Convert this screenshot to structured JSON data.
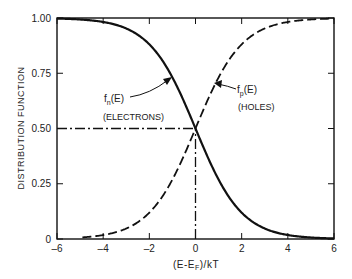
{
  "chart_data": {
    "type": "line",
    "title": "",
    "xlabel": "(E-E_F)/kT",
    "ylabel": "DISTRIBUTION FUNCTION",
    "xlim": [
      -6,
      6
    ],
    "ylim": [
      0,
      1.0
    ],
    "x_ticks": [
      "-6",
      "-4",
      "-2",
      "0",
      "2",
      "4",
      "6"
    ],
    "y_ticks": [
      "0",
      "0.25",
      "0.50",
      "0.75",
      "1.00"
    ],
    "grid": false,
    "x": [
      -6,
      -5,
      -4,
      -3,
      -2,
      -1,
      0,
      1,
      2,
      3,
      4,
      5,
      6
    ],
    "series": [
      {
        "name": "f_n(E) (ELECTRONS)",
        "style": "solid",
        "values": [
          0.998,
          0.993,
          0.982,
          0.953,
          0.881,
          0.731,
          0.5,
          0.269,
          0.119,
          0.047,
          0.018,
          0.007,
          0.002
        ]
      },
      {
        "name": "f_p(E) (HOLES)",
        "style": "dashed",
        "values": [
          0.002,
          0.007,
          0.018,
          0.047,
          0.119,
          0.269,
          0.5,
          0.731,
          0.881,
          0.953,
          0.982,
          0.993,
          0.998
        ]
      }
    ],
    "reference_lines": [
      {
        "type": "horizontal",
        "y": 0.5,
        "x_range": [
          -6,
          0
        ],
        "style": "dash-dot"
      },
      {
        "type": "vertical",
        "x": 0,
        "y_range": [
          0,
          0.5
        ],
        "style": "dash-dot"
      }
    ],
    "annotations": [
      {
        "text": "f_n(E)",
        "subtext": "(ELECTRONS)",
        "points_to": "f_n curve near x=-0.7"
      },
      {
        "text": "f_p(E)",
        "subtext": "(HOLES)",
        "points_to": "f_p curve near x=0.7"
      }
    ]
  },
  "labels": {
    "ylabel": "DISTRIBUTION FUNCTION",
    "xlabel_pre": "(E-E",
    "xlabel_sub": "F",
    "xlabel_post": ")/kT",
    "fn_main": "f",
    "fn_sub": "n",
    "fn_arg": "(E)",
    "fn_desc": "(ELECTRONS)",
    "fp_main": "f",
    "fp_sub": "p",
    "fp_arg": "(E)",
    "fp_desc": "(HOLES)"
  }
}
